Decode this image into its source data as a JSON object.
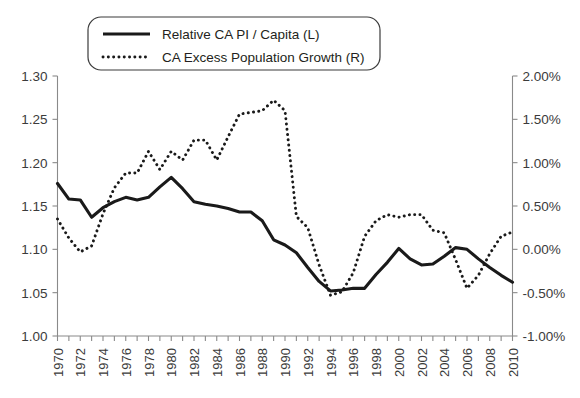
{
  "chart_data": {
    "type": "line",
    "title": "",
    "xlabel": "",
    "ylabel": "",
    "grid": false,
    "legend_position": "top-center",
    "x": [
      1970,
      1971,
      1972,
      1973,
      1974,
      1975,
      1976,
      1977,
      1978,
      1979,
      1980,
      1981,
      1982,
      1983,
      1984,
      1985,
      1986,
      1987,
      1988,
      1989,
      1990,
      1991,
      1992,
      1993,
      1994,
      1995,
      1996,
      1997,
      1998,
      1999,
      2000,
      2001,
      2002,
      2003,
      2004,
      2005,
      2006,
      2007,
      2008,
      2009,
      2010
    ],
    "xlim": [
      1970,
      2010
    ],
    "xtick_labels": [
      "1970",
      "1972",
      "1974",
      "1976",
      "1978",
      "1980",
      "1982",
      "1984",
      "1986",
      "1988",
      "1990",
      "1992",
      "1994",
      "1996",
      "1998",
      "2000",
      "2002",
      "2004",
      "2006",
      "2008",
      "2010"
    ],
    "left_axis": {
      "label": "",
      "ylim": [
        1.0,
        1.3
      ],
      "tick_values": [
        1.0,
        1.05,
        1.1,
        1.15,
        1.2,
        1.25,
        1.3
      ],
      "tick_labels": [
        "1.00",
        "1.05",
        "1.10",
        "1.15",
        "1.20",
        "1.25",
        "1.30"
      ]
    },
    "right_axis": {
      "label": "",
      "ylim": [
        -1.0,
        2.0
      ],
      "tick_values": [
        -1.0,
        -0.5,
        0.0,
        0.5,
        1.0,
        1.5,
        2.0
      ],
      "tick_labels": [
        "-1.00%",
        "-0.50%",
        "0.00%",
        "0.50%",
        "1.00%",
        "1.50%",
        "2.00%"
      ]
    },
    "series": [
      {
        "name": "Relative CA PI / Capita (L)",
        "axis": "left",
        "style": "solid",
        "color": "#1a1a1a",
        "values": [
          1.176,
          1.158,
          1.157,
          1.137,
          1.148,
          1.155,
          1.16,
          1.157,
          1.16,
          1.172,
          1.183,
          1.17,
          1.155,
          1.152,
          1.15,
          1.147,
          1.143,
          1.143,
          1.133,
          1.111,
          1.105,
          1.096,
          1.079,
          1.063,
          1.052,
          1.053,
          1.055,
          1.055,
          1.071,
          1.085,
          1.101,
          1.089,
          1.082,
          1.083,
          1.092,
          1.102,
          1.1,
          1.089,
          1.079,
          1.07,
          1.062
        ]
      },
      {
        "name": "CA Excess Population Growth (R)",
        "axis": "right",
        "style": "dotted",
        "color": "#1a1a1a",
        "values": [
          0.35,
          0.13,
          -0.03,
          0.04,
          0.41,
          0.71,
          0.88,
          0.88,
          1.13,
          0.92,
          1.13,
          1.03,
          1.26,
          1.26,
          1.03,
          1.3,
          1.56,
          1.58,
          1.6,
          1.72,
          1.6,
          0.38,
          0.25,
          -0.18,
          -0.53,
          -0.49,
          -0.27,
          0.15,
          0.33,
          0.4,
          0.37,
          0.4,
          0.4,
          0.22,
          0.19,
          -0.12,
          -0.45,
          -0.3,
          -0.05,
          0.15,
          0.2
        ]
      }
    ]
  },
  "legend": {
    "items": [
      {
        "label": "Relative CA PI / Capita (L)",
        "style": "solid"
      },
      {
        "label": "CA Excess Population Growth (R)",
        "style": "dotted"
      }
    ]
  }
}
